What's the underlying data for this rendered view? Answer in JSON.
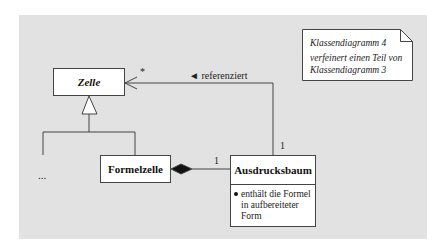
{
  "diagram": {
    "type": "UML class diagram",
    "background_color": "#e2e2e2",
    "classes": [
      {
        "id": "zelle",
        "name": "Zelle",
        "abstract": true
      },
      {
        "id": "formelzelle",
        "name": "Formelzelle"
      },
      {
        "id": "ausdrucksbaum",
        "name": "Ausdrucksbaum",
        "attributes": {
          "bullet": "enthält die Formel",
          "line2": "in aufbereiteter",
          "line3": "Form"
        }
      }
    ],
    "ellipsis": "...",
    "relations": {
      "generalization": {
        "parent": "Zelle",
        "children": [
          "Formelzelle",
          "..."
        ]
      },
      "association": {
        "from": "Ausdrucksbaum",
        "to": "Zelle",
        "label": "◄ referenziert",
        "multiplicity_to": "*",
        "multiplicity_from": "1"
      },
      "composition": {
        "whole": "Formelzelle",
        "part": "Ausdrucksbaum",
        "multiplicity_part": "1"
      }
    },
    "note": {
      "line1": "Klassendiagramm 4",
      "line2": "verfeinert einen Teil von",
      "line3": "Klassendiagramm 3"
    }
  }
}
